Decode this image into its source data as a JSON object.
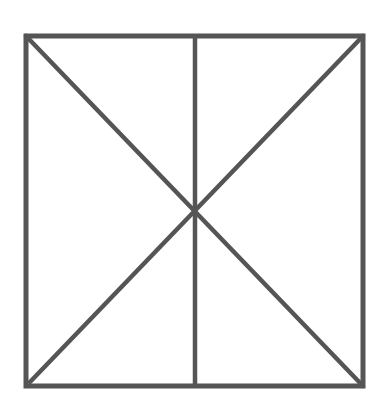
{
  "figure": {
    "stroke_color": "#555555",
    "background_color": "#ffffff",
    "stroke_width": 5,
    "square": {
      "x1": 26,
      "y1": 36,
      "x2": 363,
      "y2": 386
    },
    "vertical_line": {
      "x": 195,
      "y1": 36,
      "y2": 386
    },
    "diagonals": [
      {
        "x1": 26,
        "y1": 36,
        "x2": 363,
        "y2": 386
      },
      {
        "x1": 363,
        "y1": 36,
        "x2": 30,
        "y2": 382
      }
    ]
  }
}
